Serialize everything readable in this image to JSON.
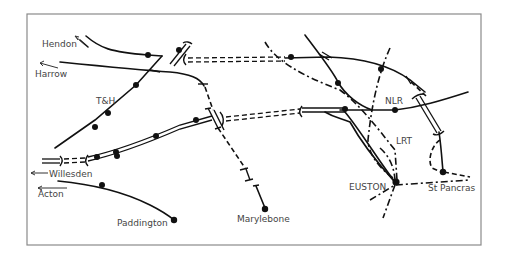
{
  "diagram": {
    "type": "railway-schematic",
    "frame": {
      "x": 27,
      "y": 14,
      "width": 454,
      "height": 231,
      "stroke": "#8a8a8a"
    },
    "labels": {
      "hendon": "Hendon",
      "harrow": "Harrow",
      "th": "T&H",
      "willesden": "Willesden",
      "acton": "Acton",
      "paddington": "Paddington",
      "marylebone": "Marylebone",
      "nlr": "NLR",
      "lrt": "LRT",
      "euston": "EUSTON",
      "st_pancras": "St Pancras"
    },
    "line_styles": {
      "solid": "existing railway line",
      "dashed": "tunnel / proposed line",
      "dash-dot": "LRT (underground) line",
      "double": "multi-track main line"
    },
    "stations": [
      "Hendon",
      "Harrow",
      "Willesden",
      "Acton",
      "Paddington",
      "Marylebone",
      "EUSTON",
      "St Pancras"
    ],
    "line_codes": [
      "T&H",
      "NLR",
      "LRT"
    ],
    "ink_color": "#111111",
    "label_color": "#444444"
  }
}
